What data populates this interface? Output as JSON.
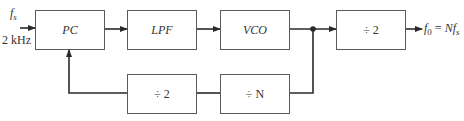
{
  "diagram": {
    "type": "block-diagram",
    "input": {
      "symbol": "f",
      "subscript": "s",
      "frequency": "2 kHz"
    },
    "output": {
      "lhs_symbol": "f",
      "lhs_subscript": "0",
      "equals": "=",
      "rhs": "Nf",
      "rhs_subscript": "s"
    },
    "blocks": [
      {
        "id": "pc",
        "label": "PC"
      },
      {
        "id": "lpf",
        "label": "LPF"
      },
      {
        "id": "vco",
        "label": "VCO"
      },
      {
        "id": "div2_out",
        "label": "÷ 2"
      },
      {
        "id": "div2_fb",
        "label": "÷ 2"
      },
      {
        "id": "divN",
        "label": "÷ N"
      }
    ],
    "connections": [
      {
        "from": "input",
        "to": "pc"
      },
      {
        "from": "pc",
        "to": "lpf"
      },
      {
        "from": "lpf",
        "to": "vco"
      },
      {
        "from": "vco",
        "to": "junction"
      },
      {
        "from": "junction",
        "to": "div2_out"
      },
      {
        "from": "div2_out",
        "to": "output"
      },
      {
        "from": "junction",
        "to": "divN"
      },
      {
        "from": "divN",
        "to": "div2_fb"
      },
      {
        "from": "div2_fb",
        "to": "pc"
      }
    ],
    "colors": {
      "line": "#2a2a2a",
      "box_border": "#5a5a5a",
      "background": "#ffffff"
    }
  }
}
